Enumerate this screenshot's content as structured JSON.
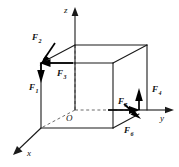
{
  "figure": {
    "background_color": "#ffffff",
    "line_color": "#1a1a1a",
    "hidden_line_color": "#6b6b6b",
    "force_color": "#000000"
  },
  "axes": {
    "origin_label": "O",
    "z": {
      "label": "z",
      "direction": "up"
    },
    "y": {
      "label": "y",
      "direction": "right"
    },
    "x": {
      "label": "x",
      "direction": "down-left"
    }
  },
  "forces": [
    {
      "id": "F1",
      "name": "F",
      "subscript": "1",
      "label": "F₁",
      "direction": "down",
      "applied_at": "top-front-left-corner"
    },
    {
      "id": "F2",
      "name": "F",
      "subscript": "2",
      "label": "F₂",
      "direction": "up-left",
      "applied_at": "top-front-left-corner"
    },
    {
      "id": "F3",
      "name": "F",
      "subscript": "3",
      "label": "F₃",
      "direction": "left",
      "applied_at": "top-front-left-corner"
    },
    {
      "id": "F4",
      "name": "F",
      "subscript": "4",
      "label": "F₄",
      "direction": "up",
      "applied_at": "bottom-front-right-corner"
    },
    {
      "id": "F5",
      "name": "F",
      "subscript": "5",
      "label": "F₅",
      "direction": "right",
      "applied_at": "bottom-front-right-corner"
    },
    {
      "id": "F6",
      "name": "F",
      "subscript": "6",
      "label": "F₆",
      "direction": "down-right",
      "applied_at": "bottom-front-right-corner"
    }
  ],
  "cube": {
    "visible_edges": 9,
    "hidden_edges": 3,
    "description": "Unit cube drawn in oblique projection with one vertex at the origin O"
  }
}
